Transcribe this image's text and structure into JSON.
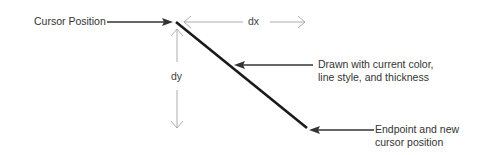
{
  "diagram": {
    "labels": {
      "cursor_position": "Cursor Position",
      "dx": "dx",
      "dy": "dy",
      "drawn_line1": "Drawn with current color,",
      "drawn_line2": "line style, and thickness",
      "endpoint_line1": "Endpoint and new",
      "endpoint_line2": "cursor position"
    },
    "colors": {
      "main_line": "#1a1a1a",
      "callout_arrow": "#333333",
      "dimension_arrow": "#999999"
    }
  }
}
